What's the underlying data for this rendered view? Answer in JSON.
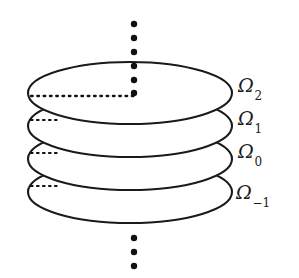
{
  "figure": {
    "background_color": "#ffffff",
    "stroke_color": "#1a1a1a",
    "dot_color": "#111111",
    "labels": [
      {
        "name": "omega-2",
        "base": "Ω",
        "subscript": "2",
        "x": 238,
        "y": 76
      },
      {
        "name": "omega-1",
        "base": "Ω",
        "subscript": "1",
        "x": 238,
        "y": 109
      },
      {
        "name": "omega-0",
        "base": "Ω",
        "subscript": "0",
        "x": 238,
        "y": 142
      },
      {
        "name": "omega-minus-1",
        "base": "Ω",
        "subscript": "−1",
        "x": 236,
        "y": 183
      }
    ],
    "disks": [
      {
        "name": "disk-omega-2",
        "cx": 130,
        "cy": 93,
        "rx": 102,
        "ry": 31,
        "radius_dash_length": 103
      },
      {
        "name": "disk-omega-1",
        "cx": 130,
        "cy": 126,
        "rx": 102,
        "ry": 31,
        "radius_dash_length": 28
      },
      {
        "name": "disk-omega-0",
        "cx": 130,
        "cy": 159,
        "rx": 102,
        "ry": 31,
        "radius_dash_length": 28
      },
      {
        "name": "disk-omega-minus-1",
        "cx": 130,
        "cy": 192,
        "rx": 102,
        "ry": 31,
        "radius_dash_length": 28
      }
    ],
    "vertical_dots_top": {
      "name": "ellipsis-top",
      "x": 134,
      "ys": [
        24,
        38,
        52,
        66,
        80,
        94
      ],
      "radius": 3.2
    },
    "vertical_dots_bottom": {
      "name": "ellipsis-bottom",
      "x": 134,
      "ys": [
        238,
        252,
        266
      ],
      "radius": 3.2
    }
  }
}
